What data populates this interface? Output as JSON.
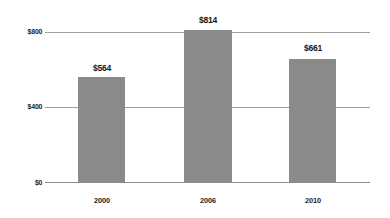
{
  "chart_data": {
    "type": "bar",
    "title": "",
    "subtitle": "",
    "xlabel": "",
    "ylabel": "",
    "categories": [
      "2000",
      "2006",
      "2010"
    ],
    "values": [
      564,
      814,
      661
    ],
    "value_labels": [
      "$564",
      "$814",
      "$661"
    ],
    "ytick_labels": [
      "$800",
      "$400",
      "$0"
    ],
    "ytick_values": [
      800,
      400,
      0
    ],
    "ylim": [
      0,
      800
    ],
    "grid": true,
    "legend": false,
    "legend_position": "none",
    "series": [
      {
        "name": "",
        "values": [
          564,
          814,
          661
        ]
      }
    ],
    "colors": {
      "bar": "#8a8a8a",
      "gridline": "#9f9f9f",
      "axis": "#8c8c8c",
      "text": "#1c1c1c",
      "background": "#ffffff"
    }
  }
}
